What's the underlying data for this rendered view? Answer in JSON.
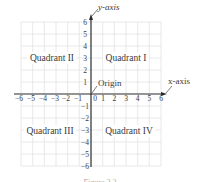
{
  "diagram": {
    "type": "cartesian-coordinate-plane",
    "x_axis_label": "x-axis",
    "y_axis_label": "y-axis",
    "origin_label": "Origin",
    "quadrants": [
      {
        "id": "I",
        "label": "Quadrant I"
      },
      {
        "id": "II",
        "label": "Quadrant II"
      },
      {
        "id": "III",
        "label": "Quadrant III"
      },
      {
        "id": "IV",
        "label": "Quadrant IV"
      }
    ],
    "x_ticks": [
      "−6",
      "−5",
      "−4",
      "−3",
      "−2",
      "−1",
      "0",
      "1",
      "2",
      "3",
      "4",
      "5",
      "6"
    ],
    "y_ticks_positive": [
      "6",
      "5",
      "4",
      "3",
      "2",
      "1"
    ],
    "y_ticks_negative": [
      "−1",
      "−2",
      "−3",
      "−4",
      "−5",
      "−6"
    ],
    "x_range": [
      -6,
      6
    ],
    "y_range": [
      -6,
      6
    ],
    "grid": true,
    "colors": {
      "axis": "#2a2a2a",
      "grid": "#e2e2e2",
      "text": "#3a3a3a"
    },
    "caption": "Figure 2.2"
  }
}
